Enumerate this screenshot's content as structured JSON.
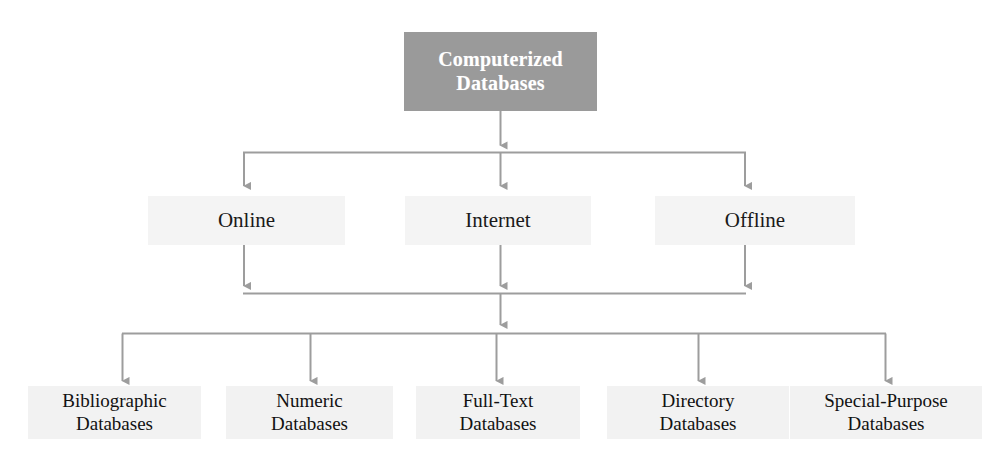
{
  "diagram": {
    "title": "Computerized Databases",
    "type": "hierarchy-tree",
    "colors": {
      "root_box_fill": "#9a9a9a",
      "root_text": "#ffffff",
      "level_box_fill": "#f4f4f4",
      "leaf_box_fill": "#f2f2f2",
      "text": "#111111",
      "connector": "#9d9d9d",
      "background": "#ffffff"
    },
    "levels": [
      {
        "level": 1,
        "nodes": [
          {
            "id": "root",
            "label": "Computerized Databases",
            "line1": "Computerized",
            "line2": "Databases"
          }
        ]
      },
      {
        "level": 2,
        "nodes": [
          {
            "id": "online",
            "label": "Online"
          },
          {
            "id": "internet",
            "label": "Internet"
          },
          {
            "id": "offline",
            "label": "Offline"
          }
        ]
      },
      {
        "level": 3,
        "nodes": [
          {
            "id": "bibliographic",
            "label": "Bibliographic Databases",
            "line1": "Bibliographic",
            "line2": "Databases"
          },
          {
            "id": "numeric",
            "label": "Numeric Databases",
            "line1": "Numeric",
            "line2": "Databases"
          },
          {
            "id": "fulltext",
            "label": "Full-Text Databases",
            "line1": "Full-Text",
            "line2": "Databases"
          },
          {
            "id": "directory",
            "label": "Directory Databases",
            "line1": "Directory",
            "line2": "Databases"
          },
          {
            "id": "special",
            "label": "Special-Purpose Databases",
            "line1": "Special-Purpose",
            "line2": "Databases"
          }
        ]
      }
    ]
  }
}
